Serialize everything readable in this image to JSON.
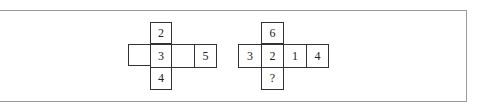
{
  "figure": {
    "nets": [
      {
        "id": "net-1",
        "cells": [
          {
            "row": 0,
            "col": 1,
            "label": "2"
          },
          {
            "row": 1,
            "col": 0,
            "label": ""
          },
          {
            "row": 1,
            "col": 1,
            "label": "3"
          },
          {
            "row": 1,
            "col": 2,
            "label": ""
          },
          {
            "row": 1,
            "col": 3,
            "label": "5"
          },
          {
            "row": 2,
            "col": 1,
            "label": "4"
          }
        ]
      },
      {
        "id": "net-2",
        "cells": [
          {
            "row": 0,
            "col": 1,
            "label": "6"
          },
          {
            "row": 1,
            "col": 0,
            "label": "3"
          },
          {
            "row": 1,
            "col": 1,
            "label": "2"
          },
          {
            "row": 1,
            "col": 2,
            "label": "1"
          },
          {
            "row": 1,
            "col": 3,
            "label": "4"
          },
          {
            "row": 2,
            "col": 1,
            "label": "?"
          }
        ]
      }
    ],
    "colors": {
      "cell_border": "#333333",
      "frame_border": "#9a9a9a",
      "text": "#222222",
      "background": "#ffffff"
    }
  }
}
